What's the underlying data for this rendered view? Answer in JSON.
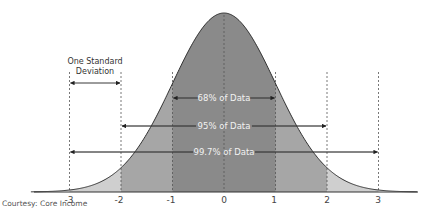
{
  "chart_data": {
    "type": "area",
    "title": "",
    "xlabel": "",
    "ylabel": "",
    "x_ticks": [
      "-3",
      "-2",
      "-1",
      "0",
      "1",
      "2",
      "3"
    ],
    "x_values": [
      -3,
      -2,
      -1,
      0,
      1,
      2,
      3
    ],
    "xlim": [
      -4,
      4
    ],
    "grid": false,
    "legend": null,
    "regions": [
      {
        "from": -1,
        "to": 1,
        "label": "68% of Data",
        "percent": 68,
        "color": "#8a8a8a"
      },
      {
        "from": -2,
        "to": 2,
        "label": "95% of Data",
        "percent": 95,
        "color": "#a6a6a6"
      },
      {
        "from": -3,
        "to": 3,
        "label": "99.7% of Data",
        "percent": 99.7,
        "color": "#cfcfcf"
      }
    ],
    "annotations": [
      {
        "text": "One Standard Deviation",
        "from": -3,
        "to": -2
      },
      {
        "text": "68% of Data",
        "from": -1,
        "to": 1
      },
      {
        "text": "95% of Data",
        "from": -2,
        "to": 2
      },
      {
        "text": "99.7% of Data",
        "from": -3,
        "to": 3
      }
    ]
  },
  "labels": {
    "one_sd_line1": "One Standard",
    "one_sd_line2": "Deviation",
    "p68": "68% of Data",
    "p95": "95% of Data",
    "p997": "99.7% of Data"
  },
  "ticks": [
    "-3",
    "-2",
    "-1",
    "0",
    "1",
    "2",
    "3"
  ],
  "credit": "Courtesy: Core Income"
}
